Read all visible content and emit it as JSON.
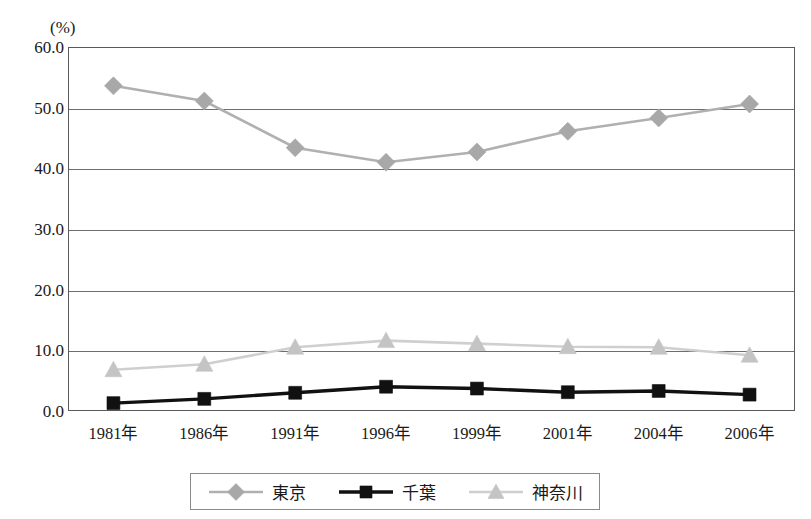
{
  "chart_data": {
    "type": "line",
    "title": "",
    "xlabel": "",
    "ylabel": "",
    "unit_label": "(%)",
    "categories": [
      "1981年",
      "1986年",
      "1991年",
      "1996年",
      "1999年",
      "2001年",
      "2004年",
      "2006年"
    ],
    "ylim": [
      0.0,
      60.0
    ],
    "ytick_labels": [
      "0.0",
      "10.0",
      "20.0",
      "30.0",
      "40.0",
      "50.0",
      "60.0"
    ],
    "ytick_values": [
      0.0,
      10.0,
      20.0,
      30.0,
      40.0,
      50.0,
      60.0
    ],
    "grid": true,
    "grid_axis": "y",
    "legend_position": "bottom",
    "series": [
      {
        "name": "東京",
        "marker": "diamond",
        "color": "#a8a8a8",
        "line_color": "#b0b0b0",
        "values": [
          53.6,
          51.1,
          43.4,
          41.0,
          42.7,
          46.1,
          48.3,
          50.6
        ]
      },
      {
        "name": "千葉",
        "marker": "square",
        "color": "#111111",
        "line_color": "#111111",
        "values": [
          1.3,
          2.0,
          3.0,
          4.0,
          3.7,
          3.1,
          3.3,
          2.7
        ]
      },
      {
        "name": "神奈川",
        "marker": "triangle",
        "color": "#c4c4c4",
        "line_color": "#cfcfcf",
        "values": [
          6.8,
          7.7,
          10.5,
          11.6,
          11.1,
          10.6,
          10.5,
          9.2
        ]
      }
    ]
  },
  "legend": {
    "items": [
      {
        "label": "東京"
      },
      {
        "label": "千葉"
      },
      {
        "label": "神奈川"
      }
    ]
  },
  "colors": {
    "tokyo": "#a8a8a8",
    "chiba": "#111111",
    "kanagawa": "#c4c4c4",
    "axis": "#5a5a5a",
    "grid": "#6e6e6e",
    "text": "#1a1a1a"
  }
}
